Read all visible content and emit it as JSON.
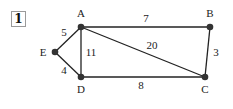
{
  "problem_number": "1",
  "graph": {
    "edge_color": "#222222",
    "node_color": "#333333",
    "nodes": [
      {
        "id": "A",
        "label": "A",
        "x": 81,
        "y": 27,
        "label_x": 81,
        "label_y": 17
      },
      {
        "id": "B",
        "label": "B",
        "x": 210,
        "y": 27,
        "label_x": 210,
        "label_y": 17
      },
      {
        "id": "C",
        "label": "C",
        "x": 205,
        "y": 77,
        "label_x": 205,
        "label_y": 93
      },
      {
        "id": "D",
        "label": "D",
        "x": 81,
        "y": 77,
        "label_x": 81,
        "label_y": 93
      },
      {
        "id": "E",
        "label": "E",
        "x": 55,
        "y": 52,
        "label_x": 43,
        "label_y": 56
      }
    ],
    "edges": [
      {
        "from": "A",
        "to": "B",
        "weight": "7",
        "label_x": 146,
        "label_y": 22
      },
      {
        "from": "A",
        "to": "C",
        "weight": "20",
        "label_x": 152,
        "label_y": 49
      },
      {
        "from": "A",
        "to": "D",
        "weight": "11",
        "label_x": 91,
        "label_y": 56
      },
      {
        "from": "A",
        "to": "E",
        "weight": "5",
        "label_x": 64,
        "label_y": 36
      },
      {
        "from": "B",
        "to": "C",
        "weight": "3",
        "label_x": 216,
        "label_y": 56
      },
      {
        "from": "D",
        "to": "C",
        "weight": "8",
        "label_x": 141,
        "label_y": 89
      },
      {
        "from": "E",
        "to": "D",
        "weight": "4",
        "label_x": 64,
        "label_y": 74
      }
    ]
  }
}
